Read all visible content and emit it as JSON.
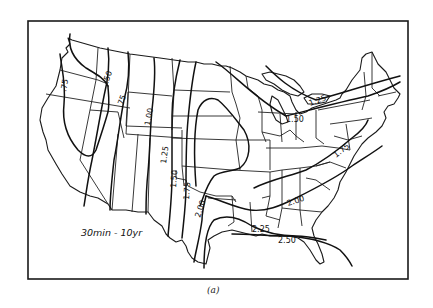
{
  "figure": {
    "subfigure_label": "(a)",
    "map_title": "30min - 10yr"
  },
  "isolines": [
    {
      "value": ".50",
      "label": ".50"
    },
    {
      "value": ".75",
      "label": ".75",
      "occurrences": 2
    },
    {
      "value": "1.00",
      "label": "1.00"
    },
    {
      "value": "1.25",
      "label": "1.25",
      "occurrences": 2
    },
    {
      "value": "1.50",
      "label": "1.50",
      "occurrences": 2
    },
    {
      "value": "1.75",
      "label": "1.75",
      "occurrences": 2
    },
    {
      "value": "2.00",
      "label": "2.00",
      "occurrences": 2
    },
    {
      "value": "2.25",
      "label": "2.25"
    },
    {
      "value": "2.50",
      "label": "2.50"
    }
  ],
  "labels": {
    "w_75": ".75",
    "nw_50": ".50",
    "mt_75": ".75",
    "wy_100": "1.00",
    "co_125": "1.25",
    "tx_150": "1.50",
    "tx_175": "1.75",
    "tx_200": "2.00",
    "gl_125": "1.25",
    "gl_150": "1.50",
    "va_175": "1.75",
    "se_200": "2.00",
    "gulf_225": "2.25",
    "gulf_250": "2.50"
  },
  "colors": {
    "ink": "#111111",
    "paper": "#ffffff"
  }
}
